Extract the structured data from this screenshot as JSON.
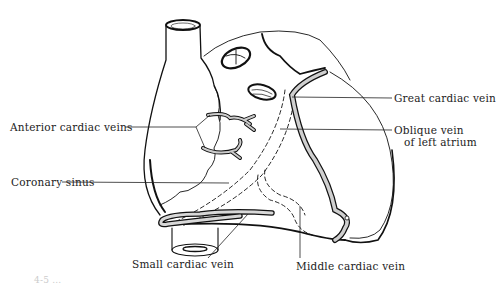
{
  "diagram": {
    "labels": [
      {
        "id": "anterior-cardiac-veins",
        "text": "Anterior cardiac veins"
      },
      {
        "id": "coronary-sinus",
        "text": "Coronary sinus"
      },
      {
        "id": "small-cardiac-vein",
        "text": "Small cardiac vein"
      },
      {
        "id": "middle-cardiac-vein",
        "text": "Middle cardiac vein"
      },
      {
        "id": "great-cardiac-vein",
        "text": "Great cardiac vein"
      },
      {
        "id": "oblique-vein-line1",
        "text": "Oblique vein"
      },
      {
        "id": "oblique-vein-line2",
        "text": "of left atrium"
      }
    ],
    "fragment": "4-5 ..."
  }
}
